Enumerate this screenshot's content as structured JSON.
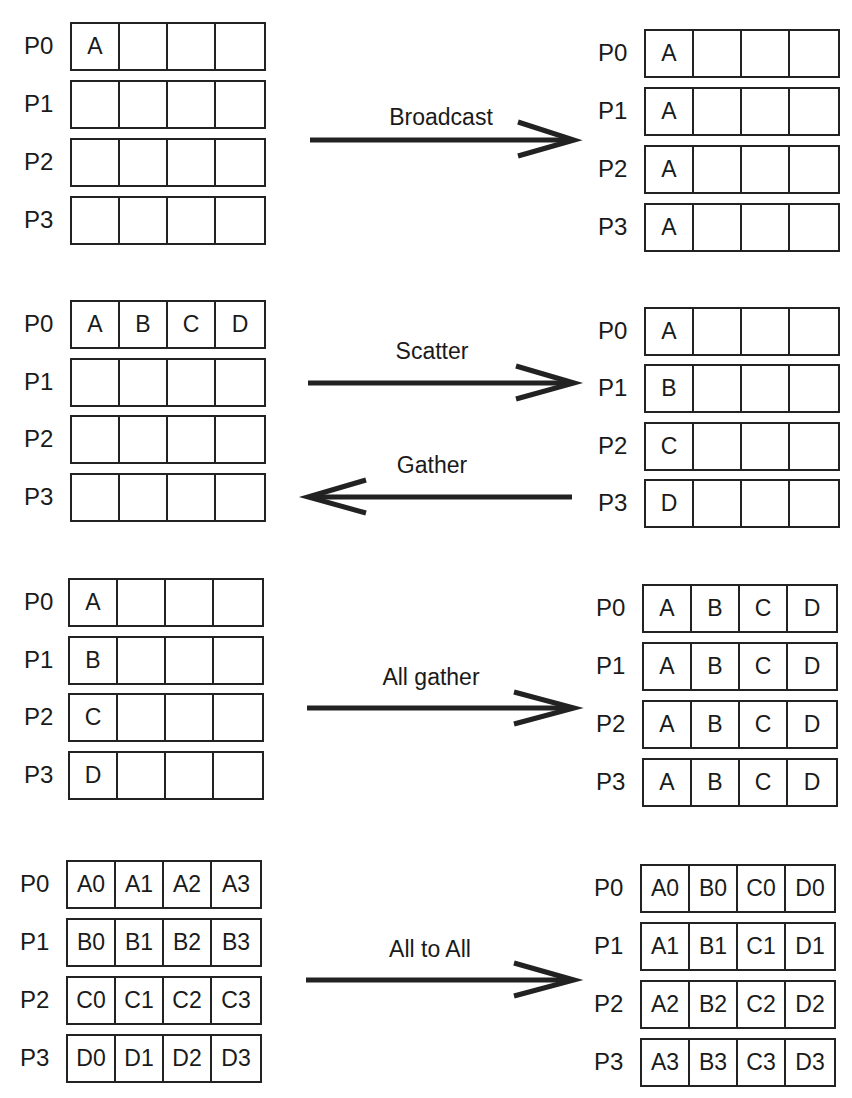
{
  "operations": [
    {
      "name": "Broadcast",
      "direction": "right",
      "left": [
        {
          "proc": "P0",
          "cells": [
            "A",
            "",
            "",
            ""
          ]
        },
        {
          "proc": "P1",
          "cells": [
            "",
            "",
            "",
            ""
          ]
        },
        {
          "proc": "P2",
          "cells": [
            "",
            "",
            "",
            ""
          ]
        },
        {
          "proc": "P3",
          "cells": [
            "",
            "",
            "",
            ""
          ]
        }
      ],
      "right": [
        {
          "proc": "P0",
          "cells": [
            "A",
            "",
            "",
            ""
          ]
        },
        {
          "proc": "P1",
          "cells": [
            "A",
            "",
            "",
            ""
          ]
        },
        {
          "proc": "P2",
          "cells": [
            "A",
            "",
            "",
            ""
          ]
        },
        {
          "proc": "P3",
          "cells": [
            "A",
            "",
            "",
            ""
          ]
        }
      ]
    },
    {
      "name": "Scatter",
      "reverse_name": "Gather",
      "direction": "both",
      "left": [
        {
          "proc": "P0",
          "cells": [
            "A",
            "B",
            "C",
            "D"
          ]
        },
        {
          "proc": "P1",
          "cells": [
            "",
            "",
            "",
            ""
          ]
        },
        {
          "proc": "P2",
          "cells": [
            "",
            "",
            "",
            ""
          ]
        },
        {
          "proc": "P3",
          "cells": [
            "",
            "",
            "",
            ""
          ]
        }
      ],
      "right": [
        {
          "proc": "P0",
          "cells": [
            "A",
            "",
            "",
            ""
          ]
        },
        {
          "proc": "P1",
          "cells": [
            "B",
            "",
            "",
            ""
          ]
        },
        {
          "proc": "P2",
          "cells": [
            "C",
            "",
            "",
            ""
          ]
        },
        {
          "proc": "P3",
          "cells": [
            "D",
            "",
            "",
            ""
          ]
        }
      ]
    },
    {
      "name": "All gather",
      "direction": "right",
      "left": [
        {
          "proc": "P0",
          "cells": [
            "A",
            "",
            "",
            ""
          ]
        },
        {
          "proc": "P1",
          "cells": [
            "B",
            "",
            "",
            ""
          ]
        },
        {
          "proc": "P2",
          "cells": [
            "C",
            "",
            "",
            ""
          ]
        },
        {
          "proc": "P3",
          "cells": [
            "D",
            "",
            "",
            ""
          ]
        }
      ],
      "right": [
        {
          "proc": "P0",
          "cells": [
            "A",
            "B",
            "C",
            "D"
          ]
        },
        {
          "proc": "P1",
          "cells": [
            "A",
            "B",
            "C",
            "D"
          ]
        },
        {
          "proc": "P2",
          "cells": [
            "A",
            "B",
            "C",
            "D"
          ]
        },
        {
          "proc": "P3",
          "cells": [
            "A",
            "B",
            "C",
            "D"
          ]
        }
      ]
    },
    {
      "name": "All to All",
      "direction": "right",
      "left": [
        {
          "proc": "P0",
          "cells": [
            "A0",
            "A1",
            "A2",
            "A3"
          ]
        },
        {
          "proc": "P1",
          "cells": [
            "B0",
            "B1",
            "B2",
            "B3"
          ]
        },
        {
          "proc": "P2",
          "cells": [
            "C0",
            "C1",
            "C2",
            "C3"
          ]
        },
        {
          "proc": "P3",
          "cells": [
            "D0",
            "D1",
            "D2",
            "D3"
          ]
        }
      ],
      "right": [
        {
          "proc": "P0",
          "cells": [
            "A0",
            "B0",
            "C0",
            "D0"
          ]
        },
        {
          "proc": "P1",
          "cells": [
            "A1",
            "B1",
            "C1",
            "D1"
          ]
        },
        {
          "proc": "P2",
          "cells": [
            "A2",
            "B2",
            "C2",
            "D2"
          ]
        },
        {
          "proc": "P3",
          "cells": [
            "A3",
            "B3",
            "C3",
            "D3"
          ]
        }
      ]
    }
  ],
  "colors": {
    "line": "#222222",
    "text": "#1a1a1a",
    "background": "#ffffff"
  }
}
